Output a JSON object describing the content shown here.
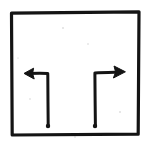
{
  "image": {
    "title": "Hand-drawn turn-arrow diagram",
    "width": 151,
    "height": 147,
    "background_color": "#ffffff",
    "ink_color": "#141414",
    "style": "hand-drawn pen sketch, scanned, black ink on white paper"
  },
  "frame": {
    "name": "border-rectangle",
    "shape": "rectangle",
    "stroke_color": "#141414",
    "stroke_width": 3.2,
    "left": 11,
    "top": 12,
    "right": 139,
    "bottom": 134
  },
  "arrows": [
    {
      "id": "left-turn-arrow",
      "direction": "left",
      "description": "vertical stem rising from a dot at the bottom, turning left at the top with an open V arrowhead pointing left",
      "stem": {
        "start_x": 48,
        "start_y": 126,
        "end_x": 48,
        "end_y": 73
      },
      "turn_segment": {
        "start_x": 48,
        "start_y": 73,
        "end_x": 26,
        "end_y": 73
      },
      "head": {
        "style": "open-v",
        "tip_x": 24,
        "tip_y": 73,
        "points_toward": "left"
      },
      "tail_dot": {
        "x": 48,
        "y": 126,
        "radius": 2.2
      }
    },
    {
      "id": "right-turn-arrow",
      "direction": "right",
      "description": "vertical stem rising from a dot at the bottom, turning right at the top with a filled triangular arrowhead pointing right",
      "stem": {
        "start_x": 95,
        "start_y": 126,
        "end_x": 95,
        "end_y": 73
      },
      "turn_segment": {
        "start_x": 95,
        "start_y": 73,
        "end_x": 118,
        "end_y": 72
      },
      "head": {
        "style": "filled-triangle",
        "tip_x": 125,
        "tip_y": 72,
        "points_toward": "right"
      },
      "tail_dot": {
        "x": 95,
        "y": 126,
        "radius": 2.2
      }
    }
  ],
  "paths": {
    "frame": "M 11.5 13.2 L 139.0 11.8 L 138.2 134.2 L 12.2 135.0 Z",
    "left_stem": "M 48.2 126.0 C 48.0 110.0 47.9 90.0 47.8 74.4",
    "left_turn": "M 47.8 73.4 C 41.0 73.2 33.0 73.3 27.2 73.6",
    "left_head": "M 24.0 73.4 L 33.6 68.2 L 32.6 73.5 L 34.2 79.0 Z",
    "right_stem": "M 95.4 126.0 C 95.2 110.0 95.0 90.0 94.9 74.2",
    "right_turn": "M 94.9 73.0 C 102.0 72.6 110.0 72.4 117.0 72.2",
    "right_head": "M 125.4 71.8 L 114.0 66.0 L 115.6 72.0 L 113.4 78.0 Z"
  },
  "specks": [
    {
      "x": 63,
      "y": 28,
      "r": 0.8
    },
    {
      "x": 88,
      "y": 44,
      "r": 0.7
    },
    {
      "x": 30,
      "y": 99,
      "r": 0.7
    },
    {
      "x": 120,
      "y": 112,
      "r": 0.8
    },
    {
      "x": 75,
      "y": 137,
      "r": 0.7
    },
    {
      "x": 18,
      "y": 58,
      "r": 0.6
    }
  ]
}
